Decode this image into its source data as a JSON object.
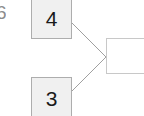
{
  "diagram": {
    "type": "node-link",
    "background_color": "#ffffff",
    "nodes": [
      {
        "id": "node-4",
        "label": "4",
        "fill_color": "#f0f0f0",
        "border_color": "#adadad"
      },
      {
        "id": "node-3",
        "label": "3",
        "fill_color": "#f0f0f0",
        "border_color": "#adadad"
      },
      {
        "id": "node-empty",
        "label": "",
        "fill_color": "#ffffff",
        "border_color": "#c8c8c8"
      }
    ],
    "edges": [
      {
        "id": "edge-4-to-empty",
        "from": "node-4",
        "to": "node-empty",
        "color": "#a0a0a0"
      },
      {
        "id": "edge-3-to-empty",
        "from": "node-3",
        "to": "node-empty",
        "color": "#a0a0a0"
      }
    ],
    "clipped_left_glyph": "6"
  }
}
